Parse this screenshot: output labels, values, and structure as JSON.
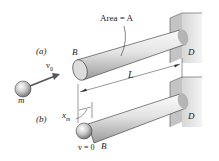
{
  "figure": {
    "labels": {
      "area": "Area = A",
      "case_a": "(a)",
      "case_b": "(b)",
      "end_b_top": "B",
      "end_d_top": "D",
      "end_b_bottom": "B",
      "end_d_bottom": "D",
      "length": "L",
      "velocity_initial": "v",
      "velocity_initial_sub": "0",
      "mass": "m",
      "displacement": "x",
      "displacement_sub": "m",
      "velocity_final": "v = 0"
    },
    "colors": {
      "rod_light": "#f2f2f2",
      "rod_mid": "#c8c8c8",
      "rod_dark": "#8a8a8a",
      "wall": "#e6e6e6",
      "wall_dark": "#bdbdbd",
      "line": "#333333"
    }
  }
}
